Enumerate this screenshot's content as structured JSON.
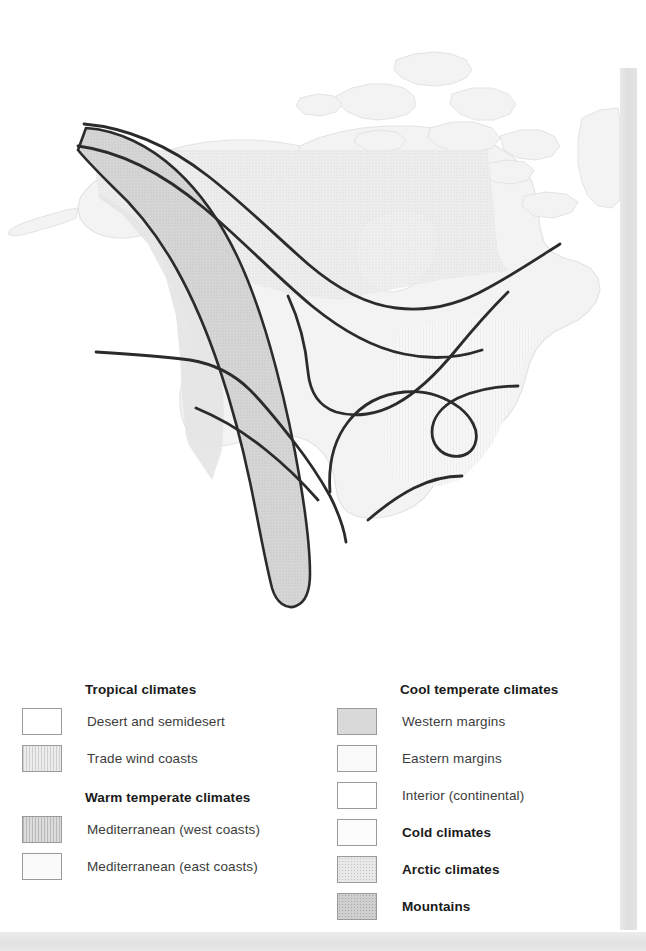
{
  "figure": {
    "kind": "climate-zone-map",
    "region": "North America"
  },
  "map": {
    "land_fill": "#f2f2f2",
    "land_stroke": "#e0e0e0",
    "mountain_fill": "#d5d5d5",
    "mountain_stroke": "#2b2b2b",
    "boundary_stroke": "#2b2b2b",
    "water_fill": "#ffffff",
    "zones": [
      {
        "name": "arctic-climates",
        "fill": "#e9e9e9"
      },
      {
        "name": "cold-climates",
        "fill": "#fbfbfb"
      },
      {
        "name": "cool-temperate-western-margins",
        "fill": "#e2e2e2"
      },
      {
        "name": "cool-temperate-eastern-margins",
        "fill": "#f6f6f6"
      },
      {
        "name": "cool-temperate-interior",
        "fill": "#ffffff"
      },
      {
        "name": "mountains",
        "fill": "#d5d5d5"
      }
    ]
  },
  "legend": {
    "left_column": {
      "groups": [
        {
          "header": "Tropical climates",
          "items": [
            {
              "label": "Desert and semidesert",
              "swatch": "white",
              "bold": false
            },
            {
              "label": "Trade wind coasts",
              "swatch": "hatch-light",
              "bold": false
            }
          ]
        },
        {
          "header": "Warm temperate climates",
          "items": [
            {
              "label": "Mediterranean (west coasts)",
              "swatch": "hatch-mid",
              "bold": false
            },
            {
              "label": "Mediterranean (east coasts)",
              "swatch": "vlight",
              "bold": false
            }
          ]
        }
      ]
    },
    "right_column": {
      "groups": [
        {
          "header": "Cool temperate climates",
          "items": [
            {
              "label": "Western margins",
              "swatch": "midgray",
              "bold": false
            },
            {
              "label": "Eastern margins",
              "swatch": "vlight",
              "bold": false
            },
            {
              "label": "Interior (continental)",
              "swatch": "white",
              "bold": false
            },
            {
              "label": "Cold climates",
              "swatch": "offwhite",
              "bold": true
            },
            {
              "label": "Arctic climates",
              "swatch": "dot-light",
              "bold": true
            },
            {
              "label": "Mountains",
              "swatch": "dot-mid",
              "bold": true
            }
          ]
        }
      ]
    }
  }
}
